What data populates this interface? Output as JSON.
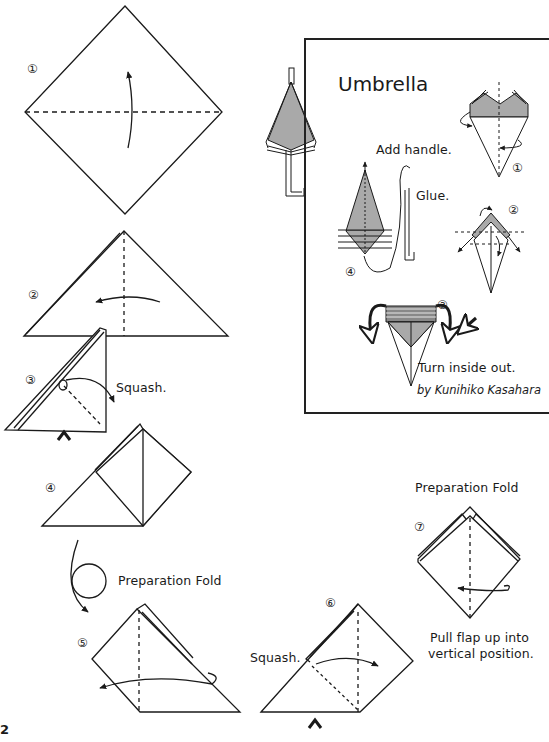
{
  "page": {
    "page_number": "2",
    "background": "#ffffff",
    "ink_color": "#1a1a1a",
    "shade_color": "#a9a9a9"
  },
  "base_steps": [
    {
      "number": "①",
      "caption": ""
    },
    {
      "number": "②",
      "caption": ""
    },
    {
      "number": "③",
      "caption": "Squash."
    },
    {
      "number": "④",
      "caption": ""
    },
    {
      "number": "⑤",
      "caption": "Preparation Fold"
    },
    {
      "number": "⑥",
      "caption": "Squash."
    },
    {
      "number": "⑦",
      "caption": "Preparation Fold",
      "note": "Pull flap up into vertical position."
    }
  ],
  "note7": {
    "line1": "Pull flap up into",
    "line2": "vertical position."
  },
  "umbrella_panel": {
    "title": "Umbrella",
    "steps": [
      {
        "number": "①",
        "caption": ""
      },
      {
        "number": "②",
        "caption": ""
      },
      {
        "number": "③",
        "caption": "Turn inside out."
      },
      {
        "number": "④",
        "caption": "Add handle.",
        "extra": "Glue."
      }
    ],
    "credit": "by Kunihiko Kasahara"
  }
}
